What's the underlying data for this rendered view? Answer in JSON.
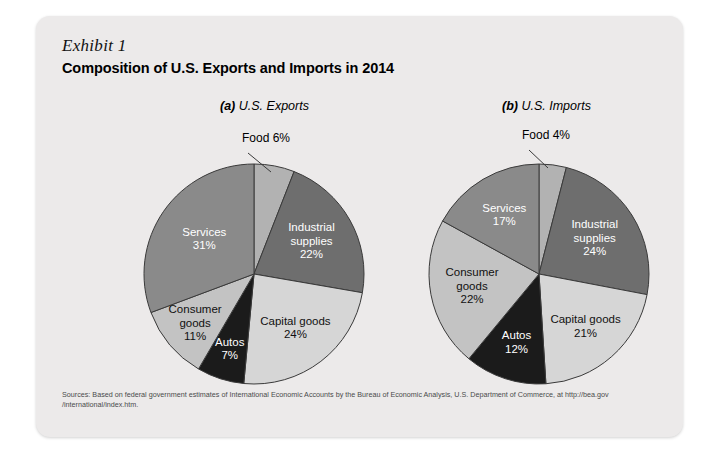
{
  "exhibit": {
    "label": "Exhibit 1",
    "title": "Composition of U.S. Exports and Imports in 2014"
  },
  "panels": {
    "a": {
      "tag": "(a)",
      "name": "U.S. Exports"
    },
    "b": {
      "tag": "(b)",
      "name": "U.S. Imports"
    }
  },
  "source": {
    "line1": "Sources: Based on federal government estimates of International Economic Accounts by the Bureau of Economic Analysis, U.S. Department of Commerce, at http://bea.gov",
    "line2": "/international/index.htm."
  },
  "colors": {
    "card_background": "#eceaea",
    "page_background": "#ffffff",
    "food": "#b2b2b2",
    "industrial_supplies": "#6e6e6e",
    "capital_goods": "#d6d6d6",
    "autos": "#1b1b1b",
    "consumer_goods": "#c3c3c3",
    "services": "#8a8a8a",
    "outline": "#3a3a3a"
  },
  "chart_data": [
    {
      "type": "pie",
      "title": "(a) U.S. Exports",
      "legend": "none",
      "start_angle_deg": 0,
      "direction": "clockwise",
      "categories": [
        "Food",
        "Industrial supplies",
        "Capital goods",
        "Autos",
        "Consumer goods",
        "Services"
      ],
      "values": [
        6,
        22,
        24,
        7,
        11,
        31
      ],
      "unit": "%",
      "slices": [
        {
          "label": "Food",
          "value": 6,
          "value_text": "6%",
          "label_text": "Food 6%",
          "color": "#b2b2b2",
          "text_color": "dark",
          "placement": "outside-callout"
        },
        {
          "label": "Industrial supplies",
          "value": 22,
          "value_text": "22%",
          "label_line1": "Industrial",
          "label_line2": "supplies",
          "color": "#6e6e6e",
          "text_color": "light",
          "placement": "inside"
        },
        {
          "label": "Capital goods",
          "value": 24,
          "value_text": "24%",
          "label_line1": "Capital goods",
          "color": "#d6d6d6",
          "text_color": "dark",
          "placement": "inside"
        },
        {
          "label": "Autos",
          "value": 7,
          "value_text": "7%",
          "label_line1": "Autos",
          "color": "#1b1b1b",
          "text_color": "light",
          "placement": "inside"
        },
        {
          "label": "Consumer goods",
          "value": 11,
          "value_text": "11%",
          "label_line1": "Consumer",
          "label_line2": "goods",
          "color": "#c3c3c3",
          "text_color": "dark",
          "placement": "inside"
        },
        {
          "label": "Services",
          "value": 31,
          "value_text": "31%",
          "label_line1": "Services",
          "color": "#8a8a8a",
          "text_color": "light",
          "placement": "inside"
        }
      ]
    },
    {
      "type": "pie",
      "title": "(b) U.S. Imports",
      "legend": "none",
      "start_angle_deg": 0,
      "direction": "clockwise",
      "categories": [
        "Food",
        "Industrial supplies",
        "Capital goods",
        "Autos",
        "Consumer goods",
        "Services"
      ],
      "values": [
        4,
        24,
        21,
        12,
        22,
        17
      ],
      "unit": "%",
      "slices": [
        {
          "label": "Food",
          "value": 4,
          "value_text": "4%",
          "label_text": "Food 4%",
          "color": "#b2b2b2",
          "text_color": "dark",
          "placement": "outside-callout"
        },
        {
          "label": "Industrial supplies",
          "value": 24,
          "value_text": "24%",
          "label_line1": "Industrial",
          "label_line2": "supplies",
          "color": "#6e6e6e",
          "text_color": "light",
          "placement": "inside"
        },
        {
          "label": "Capital goods",
          "value": 21,
          "value_text": "21%",
          "label_line1": "Capital goods",
          "color": "#d6d6d6",
          "text_color": "dark",
          "placement": "inside"
        },
        {
          "label": "Autos",
          "value": 12,
          "value_text": "12%",
          "label_line1": "Autos",
          "color": "#1b1b1b",
          "text_color": "light",
          "placement": "inside"
        },
        {
          "label": "Consumer goods",
          "value": 22,
          "value_text": "22%",
          "label_line1": "Consumer",
          "label_line2": "goods",
          "color": "#c3c3c3",
          "text_color": "dark",
          "placement": "inside"
        },
        {
          "label": "Services",
          "value": 17,
          "value_text": "17%",
          "label_line1": "Services",
          "color": "#8a8a8a",
          "text_color": "light",
          "placement": "inside"
        }
      ]
    }
  ]
}
